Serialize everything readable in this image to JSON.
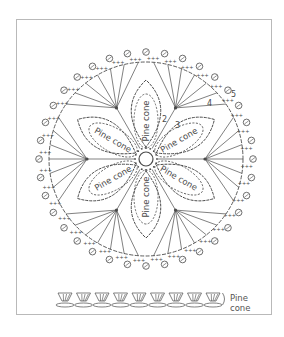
{
  "diagram": {
    "ellipse_label": "Pine cone",
    "petal_count": 6,
    "round_labels": [
      "2",
      "3",
      "4",
      "5"
    ],
    "legend": {
      "line1": "Pine",
      "line2": "cone",
      "fan_count": 9
    },
    "colors": {
      "ink": "#4a4a4a",
      "frame": "#b9b9b9",
      "background": "#ffffff"
    }
  }
}
